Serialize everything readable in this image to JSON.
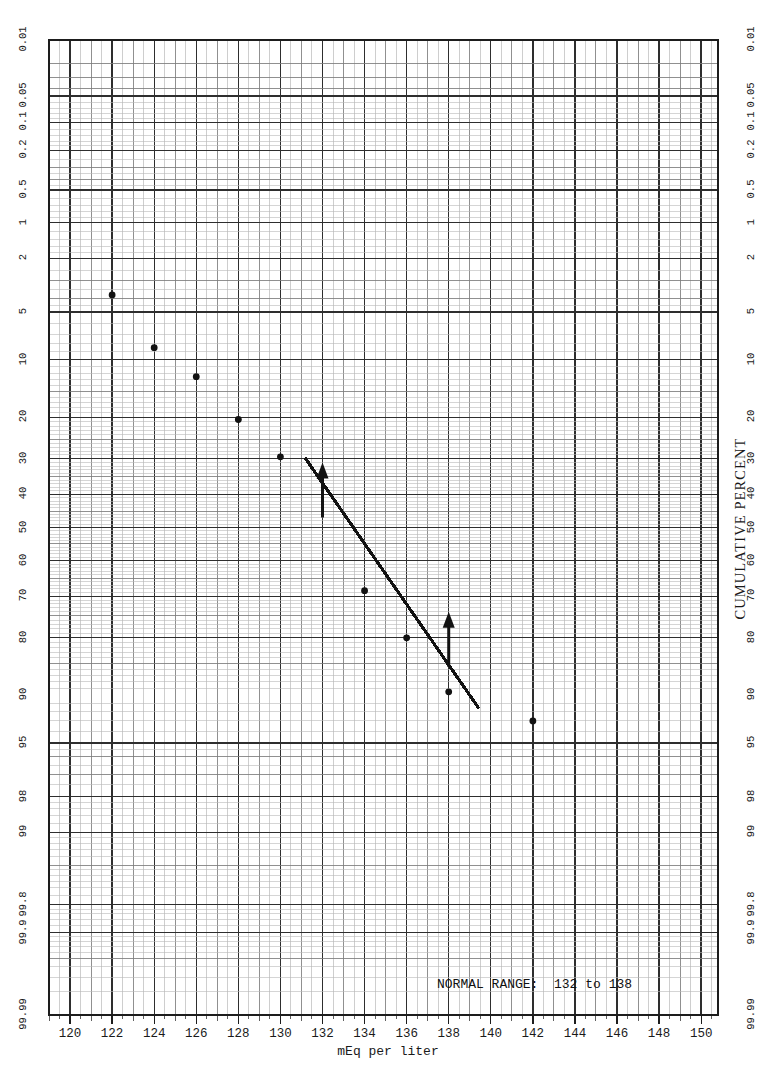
{
  "figure": {
    "kind": "normal-probability-plot",
    "background": "#ffffff",
    "grid_color_minor": "#b9b9b9",
    "grid_color_mid": "#7d7d7d",
    "grid_color_major": "#2e2e2e",
    "ink_color": "#121212"
  },
  "axes": {
    "x": {
      "label": "mEq per liter",
      "ticks": [
        "120",
        "122",
        "124",
        "126",
        "128",
        "130",
        "132",
        "134",
        "136",
        "138",
        "140",
        "142",
        "144",
        "146",
        "148",
        "150"
      ],
      "min": 119,
      "max": 150.8,
      "minor_step": 0.5
    },
    "y_left": {
      "label": "",
      "ticks": [
        "0.01",
        "0.05",
        "0.1",
        "0.2",
        "0.5",
        "1",
        "2",
        "5",
        "10",
        "20",
        "30",
        "40",
        "50",
        "60",
        "70",
        "80",
        "90",
        "95",
        "98",
        "99",
        "99.8",
        "99.9",
        "99.99"
      ]
    },
    "y_right": {
      "label": "CUMULATIVE PERCENT",
      "ticks": [
        "99.99",
        "99.9",
        "99.8",
        "99",
        "98",
        "95",
        "90",
        "80",
        "70",
        "60",
        "50",
        "40",
        "30",
        "20",
        "10",
        "5",
        "2",
        "1",
        "0.5",
        "0.2",
        "0.1",
        "0.05",
        "0.01"
      ]
    }
  },
  "annotations": {
    "normal_range_note": "NORMAL RANGE:  132 to 138",
    "arrows": [
      {
        "name": "lower-limit-arrow",
        "x": 132,
        "percent_tip": 31,
        "direction": "up"
      },
      {
        "name": "upper-limit-arrow",
        "x": 138,
        "percent_tip": 74,
        "direction": "up"
      }
    ]
  },
  "chart_data": {
    "type": "scatter",
    "title": "",
    "subtitle": "",
    "xlabel": "mEq per liter",
    "ylabel": "CUMULATIVE PERCENT",
    "xlim": [
      119,
      150.8
    ],
    "ylim_percent": [
      0.01,
      99.99
    ],
    "y_scale": "normal probability (probit)",
    "grid": true,
    "legend": false,
    "xticks": [
      120,
      122,
      124,
      126,
      128,
      130,
      132,
      134,
      136,
      138,
      140,
      142,
      144,
      146,
      148,
      150
    ],
    "yticks_percent": [
      0.01,
      0.05,
      0.1,
      0.2,
      0.5,
      1,
      2,
      5,
      10,
      20,
      30,
      40,
      50,
      60,
      70,
      80,
      90,
      95,
      98,
      99,
      99.8,
      99.9,
      99.99
    ],
    "series": [
      {
        "name": "cumulative distribution of serum sodium",
        "marker": "filled-circle",
        "points": [
          {
            "x": 122,
            "cumulative_percent": 3.8
          },
          {
            "x": 124,
            "cumulative_percent": 8.5
          },
          {
            "x": 126,
            "cumulative_percent": 12.5
          },
          {
            "x": 128,
            "cumulative_percent": 20.5
          },
          {
            "x": 130,
            "cumulative_percent": 29.5
          },
          {
            "x": 134,
            "cumulative_percent": 68.5
          },
          {
            "x": 136,
            "cumulative_percent": 80.0
          },
          {
            "x": 138,
            "cumulative_percent": 89.5
          },
          {
            "x": 142,
            "cumulative_percent": 93.0
          }
        ]
      }
    ],
    "fit_line": {
      "name": "fitted straight line",
      "x_start": 131.2,
      "percent_start": 30.0,
      "x_end": 139.4,
      "percent_end": 91.5
    },
    "reference_band": {
      "name": "normal range",
      "low": 132,
      "high": 138,
      "note": "NORMAL RANGE:  132 to 138"
    }
  }
}
